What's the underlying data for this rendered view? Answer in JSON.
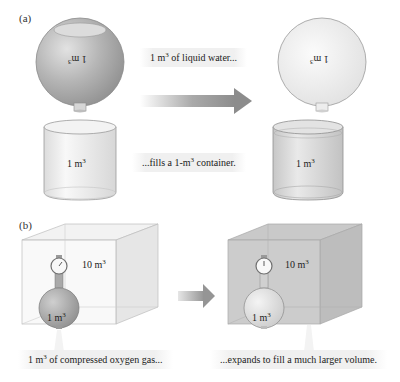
{
  "panel_a": {
    "label": "(a)",
    "left_flask": {
      "volume_number": "1",
      "volume_unit": "m",
      "volume_exp": "3",
      "fill_color": "#b9b9b9"
    },
    "right_flask": {
      "volume_number": "1",
      "volume_unit": "m",
      "volume_exp": "3",
      "fill_color": "#ececec"
    },
    "left_beaker": {
      "volume_number": "1",
      "volume_unit": "m",
      "volume_exp": "3",
      "fill_color": "#ececec"
    },
    "right_beaker": {
      "volume_number": "1",
      "volume_unit": "m",
      "volume_exp": "3",
      "fill_color": "#d6d6d6"
    },
    "caption_top": {
      "prefix": "1 m",
      "exp": "3",
      "suffix": " of liquid water..."
    },
    "caption_bottom": {
      "prefix": "...fills a 1-m",
      "exp": "3",
      "suffix": " container."
    },
    "arrow_color": "#8f8f8f"
  },
  "panel_b": {
    "label": "(b)",
    "left_cube": {
      "volume_number": "10",
      "volume_unit": "m",
      "volume_exp": "3",
      "tint": "#efefef"
    },
    "right_cube": {
      "volume_number": "10",
      "volume_unit": "m",
      "volume_exp": "3",
      "tint": "#c4c4c4"
    },
    "left_tank": {
      "volume_number": "1",
      "volume_unit": "m",
      "volume_exp": "3",
      "fill_color": "#a9a9a9"
    },
    "right_tank": {
      "volume_number": "1",
      "volume_unit": "m",
      "volume_exp": "3",
      "fill_color": "#dcdcdc"
    },
    "caption_left": {
      "prefix": "1 m",
      "exp": "3",
      "suffix": " of compressed oxygen gas..."
    },
    "caption_right": {
      "text": "...expands to fill a much larger volume."
    },
    "arrow_color": "#9a9a9a"
  }
}
